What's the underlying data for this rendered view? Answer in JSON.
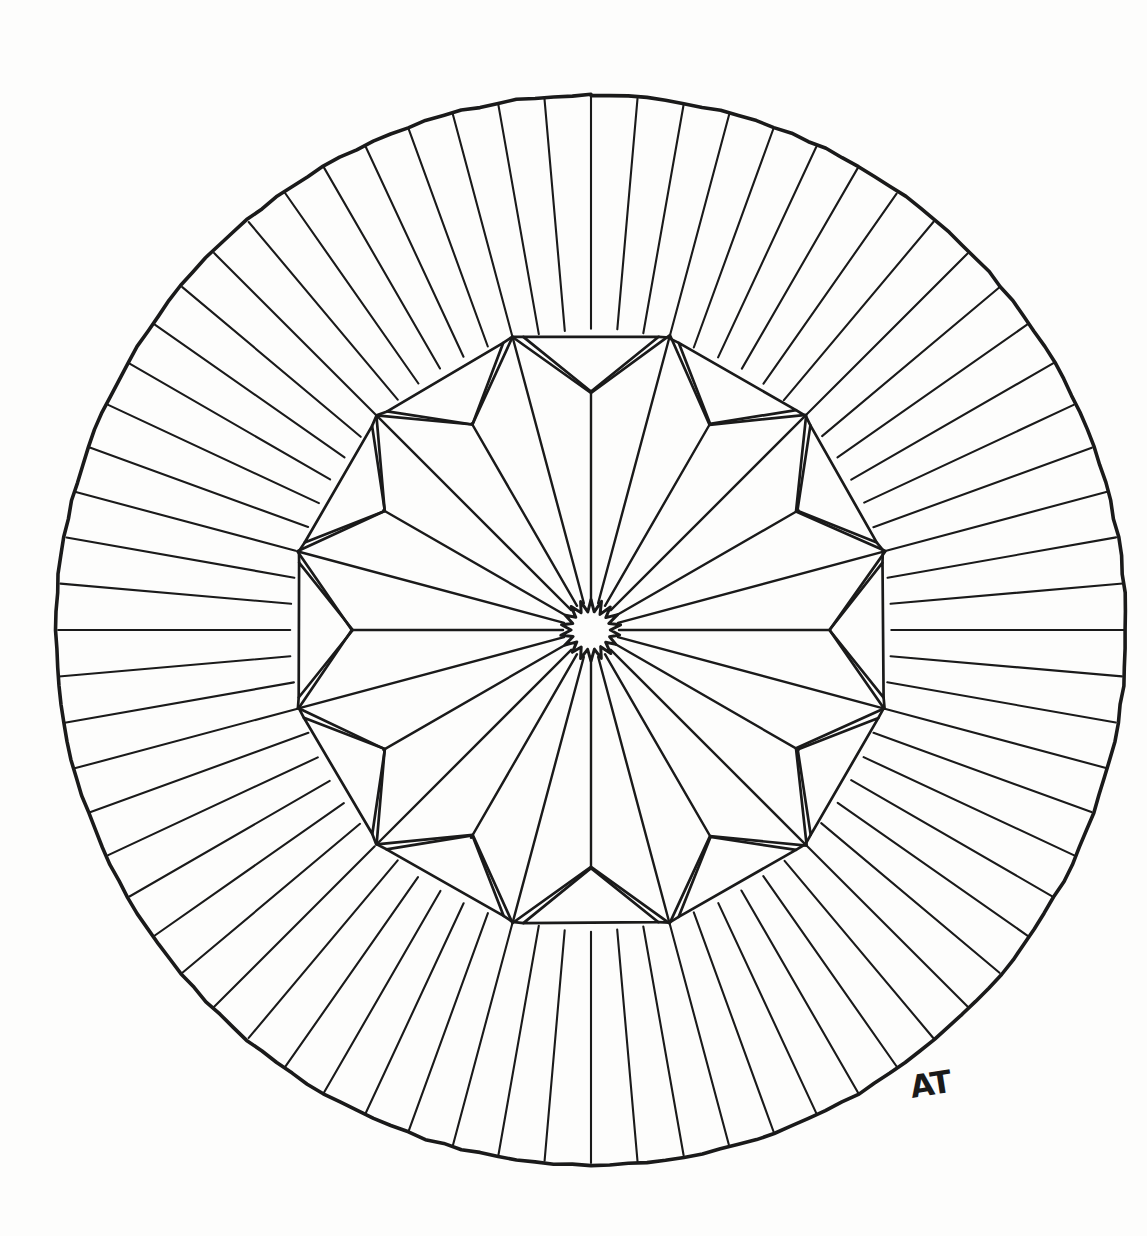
{
  "artwork": {
    "title": "Radial Mandala Rosette",
    "medium": "ink line drawing on paper",
    "signature": "AT",
    "background_color": "#fdfdfc",
    "ink_color": "#1a1a1a"
  },
  "canvas": {
    "width": 1147,
    "height": 1236
  },
  "geometry": {
    "center_x": 591,
    "center_y": 630,
    "outer_radius": 535,
    "spoke_count": 72,
    "spoke_step_degrees": 5,
    "star_points": 12,
    "star_tip_radius": 304,
    "star_notch_radius": 238,
    "panel_outer_radius": 300,
    "panel_count": 12,
    "core_star_points": 18,
    "core_star_outer_radius": 30,
    "core_star_inner_radius": 19,
    "axis_ray_count": 12
  },
  "signature_position": {
    "x": 912,
    "y": 1098
  },
  "chart_data": {
    "type": "pie",
    "categories": [
      "outer circle",
      "radial spokes",
      "twelve-pointed star",
      "shoulder panels",
      "axis rays",
      "core starburst"
    ],
    "values": [
      1,
      72,
      12,
      12,
      12,
      18
    ],
    "xlabel": "",
    "ylabel": "",
    "legend": "none",
    "grid": false
  }
}
